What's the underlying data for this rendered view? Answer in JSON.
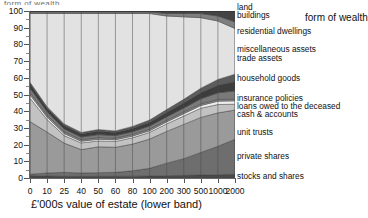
{
  "top_clipped_text": "form of wealth",
  "legend_title": "form of wealth",
  "axes": {
    "x_label": "£'000s value of estate (lower band)",
    "y_label": "",
    "y_ticks": [
      "0",
      "10",
      "20",
      "30",
      "40",
      "50",
      "60",
      "70",
      "80",
      "90",
      "100"
    ],
    "x_ticks": [
      "0",
      "10",
      "25",
      "40",
      "50",
      "60",
      "80",
      "100",
      "200",
      "300",
      "500",
      "1000",
      "2000"
    ]
  },
  "legend_items": [
    {
      "label": "land"
    },
    {
      "label": "buildings"
    },
    {
      "label": "residential dwellings"
    },
    {
      "label": "miscellaneous assets"
    },
    {
      "label": "trade assets"
    },
    {
      "label": "household goods"
    },
    {
      "label": "insurance policies"
    },
    {
      "label": "loans owed to the deceased"
    },
    {
      "label": "cash & accounts"
    },
    {
      "label": "unit trusts"
    },
    {
      "label": "private shares"
    },
    {
      "label": "stocks and shares"
    }
  ],
  "chart_data": {
    "type": "area",
    "stacked": true,
    "normalized_percent": true,
    "title": "",
    "xlabel": "£'000s value of estate (lower band)",
    "ylabel": "",
    "ylim": [
      0,
      100
    ],
    "grid": "vertical",
    "legend_position": "right",
    "legend_title": "form of wealth",
    "categories": [
      "0",
      "10",
      "25",
      "40",
      "50",
      "60",
      "80",
      "100",
      "200",
      "300",
      "500",
      "1000",
      "2000"
    ],
    "series": [
      {
        "name": "stocks and shares",
        "color": "#4a4a4a",
        "values": [
          1.5,
          1.2,
          1.0,
          1.0,
          1.0,
          1.0,
          1.1,
          1.2,
          1.4,
          1.6,
          1.8,
          2.0,
          2.2
        ]
      },
      {
        "name": "private shares",
        "color": "#6e6e6e",
        "values": [
          0.8,
          1.8,
          2.4,
          2.0,
          2.2,
          2.4,
          3.2,
          4.6,
          7.5,
          10.0,
          13.5,
          17.0,
          21.0
        ]
      },
      {
        "name": "unit trusts",
        "color": "#9a9a9a",
        "values": [
          31.5,
          24.5,
          17.5,
          14.0,
          15.5,
          15.0,
          16.0,
          17.5,
          19.0,
          20.5,
          21.0,
          20.0,
          17.5
        ]
      },
      {
        "name": "cash & accounts",
        "color": "#c2c2c2",
        "values": [
          14.0,
          7.5,
          4.5,
          4.0,
          3.5,
          3.5,
          3.8,
          4.0,
          4.5,
          5.0,
          5.5,
          5.0,
          3.5
        ]
      },
      {
        "name": "loans owed to the deceased",
        "color": "#efefef",
        "values": [
          2.0,
          1.5,
          1.2,
          1.0,
          1.0,
          1.0,
          1.0,
          1.0,
          1.2,
          1.4,
          1.6,
          2.0,
          2.0
        ]
      },
      {
        "name": "insurance policies",
        "color": "#8c8c8c",
        "values": [
          1.5,
          1.2,
          1.0,
          1.0,
          1.0,
          1.0,
          1.0,
          1.0,
          1.0,
          1.0,
          1.0,
          1.0,
          1.0
        ]
      },
      {
        "name": "household goods",
        "color": "#7a7a7a",
        "values": [
          2.5,
          2.0,
          1.8,
          1.5,
          1.8,
          1.5,
          1.6,
          1.8,
          2.0,
          2.4,
          3.0,
          4.0,
          5.0
        ]
      },
      {
        "name": "trade assets",
        "color": "#3d3d3d",
        "values": [
          2.5,
          2.0,
          2.0,
          1.8,
          2.0,
          1.8,
          2.0,
          2.2,
          2.6,
          3.0,
          3.6,
          4.5,
          5.5
        ]
      },
      {
        "name": "miscellaneous assets",
        "color": "#5c5c5c",
        "values": [
          1.0,
          1.0,
          1.0,
          1.0,
          1.0,
          1.0,
          1.2,
          1.4,
          1.8,
          2.2,
          2.8,
          3.5,
          4.5
        ]
      },
      {
        "name": "residential dwellings",
        "color": "#e2e2e2",
        "values": [
          41.2,
          55.8,
          66.1,
          71.2,
          69.5,
          70.3,
          67.6,
          63.8,
          56.0,
          49.4,
          42.2,
          35.0,
          27.3
        ]
      },
      {
        "name": "buildings",
        "color": "#7f7f7f",
        "values": [
          1.0,
          1.0,
          1.0,
          1.0,
          1.0,
          1.0,
          1.0,
          1.0,
          1.5,
          2.0,
          2.5,
          3.0,
          4.0
        ]
      },
      {
        "name": "land",
        "color": "#444444",
        "values": [
          0.5,
          0.5,
          0.5,
          0.5,
          0.5,
          0.5,
          0.5,
          0.5,
          1.5,
          1.5,
          1.5,
          3.0,
          6.5
        ]
      }
    ]
  }
}
